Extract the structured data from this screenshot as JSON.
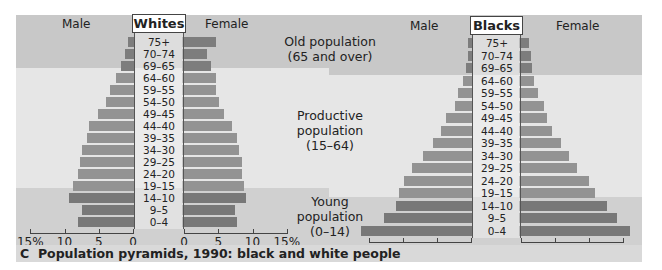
{
  "caption": {
    "letter": "C",
    "text": "Population pyramids, 1990: black and white people"
  },
  "groups": {
    "old": [
      "Old population",
      "(65 and over)"
    ],
    "productive": [
      "Productive",
      "population",
      "(15–64)"
    ],
    "young": [
      "Young",
      "population",
      "(0–14)"
    ]
  },
  "labels": {
    "male": "Male",
    "female": "Female"
  },
  "axis_ticks": [
    "15%",
    "10",
    "5",
    "0"
  ],
  "axis_ticks_right": [
    "0",
    "5",
    "10",
    "15%"
  ],
  "colors": {
    "old_band": "#c8c8c8",
    "productive_band": "#e6e6e6",
    "young_band": "#d0d0d0",
    "bar_old": "#7d7d7d",
    "bar_productive": "#939393",
    "bar_young": "#787878"
  },
  "chart_data": [
    {
      "type": "bar",
      "title": "Whites",
      "orientation": "horizontal-pyramid",
      "xlabel": "% of population",
      "xlim": [
        0,
        15
      ],
      "categories": [
        "75+",
        "70–74",
        "69–65",
        "64–60",
        "59–55",
        "54–50",
        "49–45",
        "44–40",
        "39–35",
        "34–30",
        "29–25",
        "24–20",
        "19–15",
        "14–10",
        "9–5",
        "0–4"
      ],
      "series": [
        {
          "name": "Male",
          "values": [
            0.8,
            1.2,
            1.7,
            2.5,
            3.3,
            3.9,
            5.1,
            6.4,
            6.7,
            7.4,
            7.8,
            8.1,
            8.8,
            9.3,
            7.5,
            8.0
          ]
        },
        {
          "name": "Female",
          "values": [
            4.7,
            3.4,
            4.0,
            4.7,
            4.7,
            5.1,
            5.9,
            7.0,
            7.8,
            8.1,
            8.5,
            8.5,
            8.8,
            9.1,
            7.5,
            7.8
          ]
        }
      ],
      "bands": [
        {
          "label": "Old population (65 and over)",
          "rows": [
            "75+",
            "70–74",
            "69–65"
          ]
        },
        {
          "label": "Productive population (15–64)",
          "rows": [
            "64–60",
            "19–15"
          ]
        },
        {
          "label": "Young population (0–14)",
          "rows": [
            "14–10",
            "9–5",
            "0–4"
          ]
        }
      ]
    },
    {
      "type": "bar",
      "title": "Blacks",
      "orientation": "horizontal-pyramid",
      "xlabel": "% of population",
      "xlim": [
        0,
        15
      ],
      "categories": [
        "75+",
        "70–74",
        "69–65",
        "64–60",
        "59–55",
        "54–50",
        "49–45",
        "44–40",
        "39–35",
        "34–30",
        "29–25",
        "24–20",
        "19–15",
        "14–10",
        "9–5",
        "0–4"
      ],
      "series": [
        {
          "name": "Male",
          "values": [
            0.4,
            0.5,
            0.8,
            1.2,
            1.9,
            2.4,
            3.7,
            4.4,
            5.6,
            7.1,
            8.7,
            9.8,
            10.6,
            11.0,
            12.8,
            16.2
          ]
        },
        {
          "name": "Female",
          "values": [
            1.2,
            1.5,
            1.6,
            1.9,
            2.5,
            3.4,
            3.8,
            4.6,
            5.9,
            7.1,
            8.2,
            10.0,
            10.9,
            12.6,
            14.1,
            16.0
          ]
        }
      ]
    }
  ]
}
